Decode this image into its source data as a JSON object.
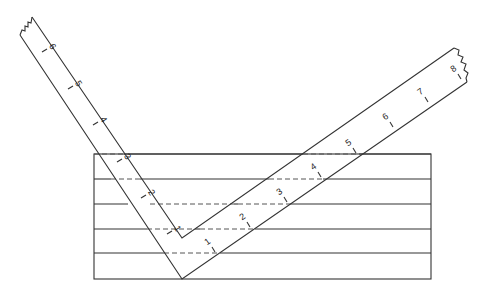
{
  "diagram": {
    "type": "framing-square-on-board",
    "board": {
      "x": 94,
      "y": 154,
      "width": 337,
      "height": 125,
      "rows_y": [
        179,
        204,
        229,
        253
      ]
    },
    "left_arm": {
      "ticks": [
        {
          "label": "1",
          "x": 167,
          "y": 234
        },
        {
          "label": "2",
          "x": 141,
          "y": 198
        },
        {
          "label": "3",
          "x": 117,
          "y": 162
        },
        {
          "label": "4",
          "x": 93,
          "y": 125
        },
        {
          "label": "5",
          "x": 68,
          "y": 89
        },
        {
          "label": "6",
          "x": 42,
          "y": 52
        }
      ]
    },
    "right_arm": {
      "ticks": [
        {
          "label": "1",
          "x": 215,
          "y": 252
        },
        {
          "label": "2",
          "x": 250,
          "y": 227
        },
        {
          "label": "3",
          "x": 287,
          "y": 202
        },
        {
          "label": "4",
          "x": 321,
          "y": 177
        },
        {
          "label": "5",
          "x": 356,
          "y": 153
        },
        {
          "label": "6",
          "x": 393,
          "y": 127
        },
        {
          "label": "7",
          "x": 428,
          "y": 102
        },
        {
          "label": "8",
          "x": 461,
          "y": 79
        }
      ]
    }
  }
}
